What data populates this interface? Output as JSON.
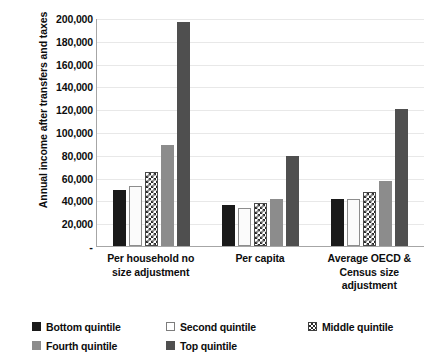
{
  "chart_data": {
    "type": "bar",
    "title": "",
    "xlabel": "",
    "ylabel": "Annual income after transfers and taxes",
    "ylim": [
      0,
      200000
    ],
    "ytick_interval": 20000,
    "grid": true,
    "legend_position": "bottom",
    "zero_tick_label": "-",
    "ytick_labels": [
      "200,000",
      "180,000",
      "160,000",
      "140,000",
      "120,000",
      "100,000",
      "80,000",
      "60,000",
      "40,000",
      "20,000",
      "-"
    ],
    "yticks": [
      200000,
      180000,
      160000,
      140000,
      120000,
      100000,
      80000,
      60000,
      40000,
      20000,
      0
    ],
    "categories": [
      "Per household no size adjustment",
      "Per capita",
      "Average OECD & Census size adjustment"
    ],
    "series": [
      {
        "name": "Bottom quintile",
        "color": "#1a1a1a",
        "pattern": "solid",
        "values": [
          49500,
          36000,
          41500
        ]
      },
      {
        "name": "Second quintile",
        "color": "#ffffff",
        "pattern": "outline",
        "values": [
          53000,
          33500,
          41000
        ]
      },
      {
        "name": "Middle quintile",
        "color": "#2b2b2b",
        "pattern": "checkered",
        "values": [
          64500,
          37500,
          47500
        ]
      },
      {
        "name": "Fourth quintile",
        "color": "#8c8c8c",
        "pattern": "solid",
        "values": [
          88500,
          41000,
          57000
        ]
      },
      {
        "name": "Top quintile",
        "color": "#4f4f4f",
        "pattern": "solid",
        "values": [
          196500,
          79000,
          120500
        ]
      }
    ]
  },
  "legend": {
    "rows": [
      [
        "Bottom quintile",
        "Second quintile",
        "Middle quintile"
      ],
      [
        "Fourth quintile",
        "Top quintile"
      ]
    ]
  },
  "colors": {
    "axis": "#a6a6a6",
    "gridline": "#e8e8e8",
    "text": "#0d0d0d",
    "plot_background": "#ffffff"
  }
}
